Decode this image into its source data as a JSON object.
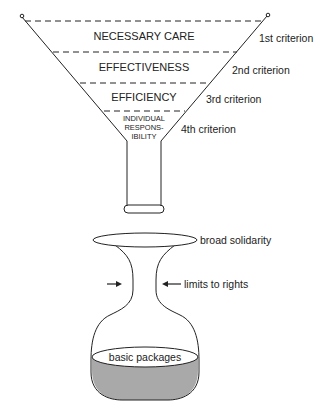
{
  "funnel": {
    "bands": [
      {
        "label": "NECESSARY CARE",
        "criterion": "1st criterion"
      },
      {
        "label": "EFFECTIVENESS",
        "criterion": "2nd criterion"
      },
      {
        "label": "EFFICIENCY",
        "criterion": "3rd criterion"
      },
      {
        "label_lines": [
          "INDIVIDUAL",
          "RESPONS-",
          "IBILITY"
        ],
        "criterion": "4th criterion"
      }
    ]
  },
  "flask": {
    "top_label": "broad solidarity",
    "neck_label": "limits to rights",
    "liquid_label": "basic packages"
  },
  "colors": {
    "stroke": "#222222",
    "liquid": "#a9a9a9"
  }
}
